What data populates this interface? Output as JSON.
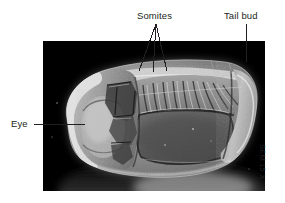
{
  "figure": {
    "type": "scanning-electron-micrograph",
    "background_color": "#ffffff",
    "photo": {
      "x": 43,
      "y": 41,
      "width": 222,
      "height": 150,
      "background_color": "#000000",
      "description": "Black-and-white scanning electron micrograph of an elongated embryo seen from the side, with a rounded head end at the left, a band of repeating segmented blocks along the upper middle, and a rounded bulbous end at the right."
    },
    "magnification_caption": "SEM 15 X"
  },
  "annotations": [
    {
      "id": "somites",
      "label": "Somites",
      "label_x": 137,
      "label_y": 10,
      "leader_style": "three-line-fan",
      "leader_apex": {
        "x": 156,
        "y": 24
      },
      "leader_targets": [
        {
          "x": 139,
          "y": 71
        },
        {
          "x": 153,
          "y": 72
        },
        {
          "x": 167,
          "y": 71
        }
      ]
    },
    {
      "id": "tail-bud",
      "label": "Tail bud",
      "label_x": 224,
      "label_y": 10,
      "leader_style": "vertical-line",
      "leader_from": {
        "x": 246,
        "y": 24
      },
      "leader_to": {
        "x": 246,
        "y": 62
      }
    },
    {
      "id": "eye",
      "label": "Eye",
      "label_x": 11,
      "label_y": 118,
      "leader_style": "horizontal-line",
      "leader_from": {
        "x": 34,
        "y": 124
      },
      "leader_to": {
        "x": 85,
        "y": 124
      }
    }
  ],
  "colors": {
    "page_background": "#ffffff",
    "text": "#231f20",
    "leader_line": "#231f20",
    "photo_background": "#000000",
    "specimen_light": "#d8d8d8",
    "specimen_mid": "#8a8a8a",
    "specimen_dark": "#3a3a3a"
  }
}
